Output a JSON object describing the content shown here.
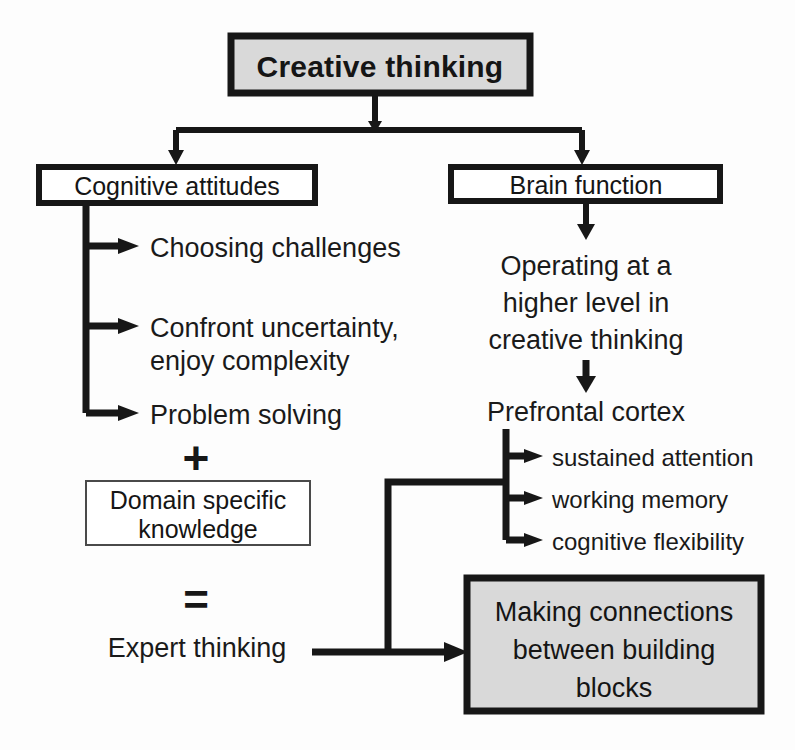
{
  "diagram": {
    "title": "Creative thinking",
    "colors": {
      "shaded_box_fill": "#d9d9d9",
      "plain_box_fill": "#ffffff",
      "stroke": "#171717",
      "text": "#151515",
      "background": "#fdfdfd"
    },
    "root": {
      "label": "Creative thinking",
      "fill": "#d9d9d9",
      "border": "thick"
    },
    "branches": [
      {
        "id": "cognitive-attitudes",
        "label": "Cognitive attitudes",
        "fill": "#ffffff",
        "border": "thick",
        "items": [
          {
            "label": "Choosing challenges"
          },
          {
            "label": "Confront uncertainty,",
            "label_line2": "enjoy complexity"
          },
          {
            "label": "Problem solving"
          }
        ],
        "operator_plus": "+",
        "knowledge_box": {
          "line1": "Domain specific",
          "line2": "knowledge",
          "fill": "#ffffff",
          "border": "thin"
        },
        "operator_equals": "=",
        "result": "Expert thinking"
      },
      {
        "id": "brain-function",
        "label": "Brain function",
        "fill": "#ffffff",
        "border": "thick",
        "process": {
          "line1": "Operating at a",
          "line2": "higher level in",
          "line3": "creative thinking"
        },
        "region": "Prefrontal cortex",
        "functions": [
          {
            "label": "sustained attention"
          },
          {
            "label": "working memory"
          },
          {
            "label": "cognitive flexibility"
          }
        ]
      }
    ],
    "outcome": {
      "id": "making-connections",
      "line1": "Making connections",
      "line2": "between building",
      "line3": "blocks",
      "fill": "#d9d9d9",
      "border": "thick"
    }
  }
}
